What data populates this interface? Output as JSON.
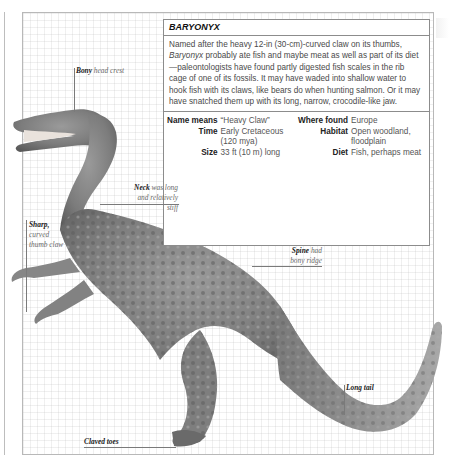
{
  "infobox": {
    "title": "BARYONYX",
    "description_prefix": "Named after the heavy 12-in (30-cm)-curved claw on its thumbs, ",
    "description_italic": "Baryonyx",
    "description_suffix": " probably ate fish and maybe meat as well as part of its diet—paleontologists have found partly digested fish scales in the rib cage of one of its fossils. It may have waded into shallow water to hook fish with its claws, like bears do when hunting salmon. Or it may have snatched them up with its long, narrow, crocodile-like jaw.",
    "facts_left": [
      {
        "label": "Name means",
        "value": "“Heavy Claw”"
      },
      {
        "label": "Time",
        "value": "Early Cretaceous (120 mya)"
      },
      {
        "label": "Size",
        "value": "33 ft (10 m) long"
      }
    ],
    "facts_right": [
      {
        "label": "Where found",
        "value": "Europe"
      },
      {
        "label": "Habitat",
        "value": "Open woodland, floodplain"
      },
      {
        "label": "Diet",
        "value": "Fish, perhaps meat"
      }
    ]
  },
  "annotations": {
    "head_crest": {
      "bold": "Bony",
      "rest": " head crest"
    },
    "neck": {
      "bold": "Neck",
      "rest": " was long",
      "line2": "and relatively stiff"
    },
    "thumb_claw": {
      "bold": "Sharp,",
      "line2": "curved",
      "line3": "thumb claw"
    },
    "spine": {
      "bold": "Spine",
      "rest": " had",
      "line2": "bony ridge"
    },
    "tail": {
      "bold": "Long tail"
    },
    "toes": {
      "bold": "Claved toes"
    }
  },
  "colors": {
    "frame": "#b8b8b8",
    "box_border": "#8c8c8c",
    "dino_dark": "#4a4a4a",
    "dino_mid": "#8a8a8a",
    "dino_light": "#bdbdbd"
  }
}
